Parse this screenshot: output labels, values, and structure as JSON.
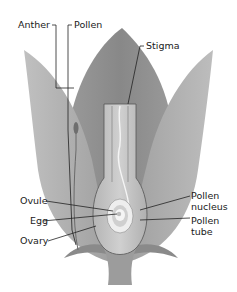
{
  "diagram": {
    "labels": {
      "anther": "Anther",
      "pollen": "Pollen",
      "stigma": "Stigma",
      "ovule": "Ovule",
      "egg": "Egg",
      "ovary": "Ovary",
      "pollen_nucleus_line1": "Pollen",
      "pollen_nucleus_line2": "nucleus",
      "pollen_tube_line1": "Pollen",
      "pollen_tube_line2": "tube"
    },
    "colors": {
      "background": "#ffffff",
      "petal_outer": "#a8a8a8",
      "petal_back": "#8f8f8f",
      "pistil": "#c4c4c4",
      "pistil_outline": "#555555",
      "ovule_highlight": "#f2f2f2",
      "label_text": "#1a1a1a"
    }
  }
}
